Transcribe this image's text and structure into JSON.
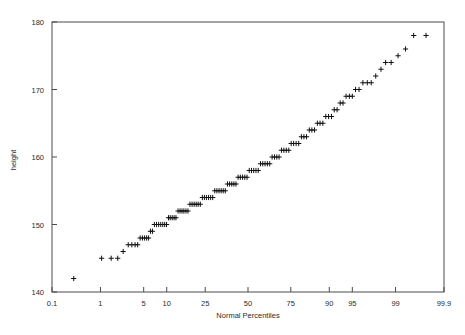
{
  "figure": {
    "kind": "normal-probability-plot",
    "background": "#ffffff",
    "frame_color": "#4a4a4a",
    "marker_color": "#111111",
    "marker_symbol": "plus"
  },
  "chart_data": {
    "type": "scatter",
    "title": "",
    "xlabel": "Normal Percentiles",
    "ylabel": "height",
    "x_scale": "normal-probability",
    "xlim": [
      0.1,
      99.9
    ],
    "ylim": [
      140,
      180
    ],
    "grid": false,
    "legend": null,
    "xticks": [
      0.1,
      1,
      5,
      10,
      25,
      50,
      75,
      90,
      95,
      99,
      99.9
    ],
    "xticklabels": [
      "0.1",
      "1",
      "5",
      "10",
      "25",
      "50",
      "75",
      "90",
      "95",
      "99",
      "99.9"
    ],
    "yticks": [
      140,
      150,
      160,
      170,
      180
    ],
    "yticklabels": [
      "140",
      "150",
      "160",
      "170",
      "180"
    ],
    "series": [
      {
        "name": "height",
        "marker": "plus",
        "x": [
          0.3,
          1.05,
          1.55,
          2.0,
          2.45,
          2.95,
          3.35,
          3.75,
          4.1,
          4.45,
          4.8,
          5.15,
          5.5,
          5.85,
          6.2,
          6.6,
          7.0,
          7.45,
          7.95,
          8.45,
          8.95,
          9.45,
          9.95,
          10.5,
          11.0,
          11.6,
          12.2,
          12.8,
          13.5,
          14.2,
          14.9,
          15.6,
          16.4,
          17.2,
          18.0,
          18.9,
          19.8,
          20.7,
          21.6,
          22.6,
          23.6,
          24.6,
          25.6,
          26.7,
          27.8,
          28.9,
          30.0,
          31.2,
          32.4,
          33.6,
          34.8,
          36.0,
          37.3,
          38.6,
          39.9,
          41.2,
          42.5,
          43.8,
          45.2,
          46.6,
          48.0,
          49.4,
          50.8,
          52.2,
          53.6,
          55.0,
          56.4,
          57.8,
          59.2,
          60.6,
          62.0,
          63.4,
          64.8,
          66.2,
          67.5,
          68.8,
          70.1,
          71.4,
          72.7,
          74.0,
          75.2,
          76.4,
          77.6,
          78.8,
          80.0,
          81.1,
          82.2,
          83.3,
          84.3,
          85.3,
          86.3,
          87.2,
          88.1,
          89.0,
          89.8,
          90.6,
          91.3,
          92.0,
          92.7,
          93.3,
          93.9,
          94.5,
          95.0,
          95.5,
          96.0,
          96.5,
          97.0,
          97.4,
          97.8,
          98.2,
          98.5,
          98.8,
          99.1,
          99.35,
          99.55,
          99.75
        ],
        "y": [
          142.0,
          145.0,
          145.0,
          145.0,
          146.0,
          147.0,
          147.0,
          147.0,
          147.0,
          148.0,
          148.0,
          148.0,
          148.0,
          148.0,
          149.0,
          149.0,
          150.0,
          150.0,
          150.0,
          150.0,
          150.0,
          150.0,
          150.0,
          151.0,
          151.0,
          151.0,
          151.0,
          151.0,
          152.0,
          152.0,
          152.0,
          152.0,
          152.0,
          152.0,
          153.0,
          153.0,
          153.0,
          153.0,
          153.0,
          153.0,
          154.0,
          154.0,
          154.0,
          154.0,
          154.0,
          154.0,
          155.0,
          155.0,
          155.0,
          155.0,
          155.0,
          155.0,
          156.0,
          156.0,
          156.0,
          156.0,
          156.0,
          157.0,
          157.0,
          157.0,
          157.0,
          157.0,
          158.0,
          158.0,
          158.0,
          158.0,
          158.0,
          159.0,
          159.0,
          159.0,
          159.0,
          159.0,
          160.0,
          160.0,
          160.0,
          160.0,
          161.0,
          161.0,
          161.0,
          161.0,
          162.0,
          162.0,
          162.0,
          162.0,
          163.0,
          163.0,
          163.0,
          164.0,
          164.0,
          164.0,
          165.0,
          165.0,
          165.0,
          166.0,
          166.0,
          166.0,
          167.0,
          167.0,
          168.0,
          168.0,
          169.0,
          169.0,
          169.0,
          170.0,
          170.0,
          171.0,
          171.0,
          171.0,
          172.0,
          173.0,
          174.0,
          174.0,
          175.0,
          176.0,
          178.0,
          178.0
        ]
      }
    ]
  }
}
